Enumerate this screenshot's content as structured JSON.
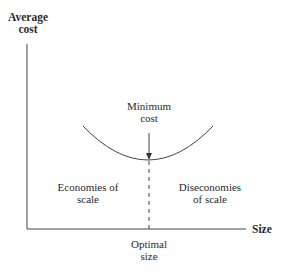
{
  "diagram": {
    "y_axis_label": [
      "Average",
      "cost"
    ],
    "x_axis_label": "Size",
    "min_label": [
      "Minimum",
      "cost"
    ],
    "left_region": [
      "Economies of",
      "scale"
    ],
    "right_region": [
      "Diseconomies",
      "of scale"
    ],
    "optimal_label": [
      "Optimal",
      "size"
    ],
    "colors": {
      "line": "#333333",
      "text": "#2a2a2a"
    }
  }
}
